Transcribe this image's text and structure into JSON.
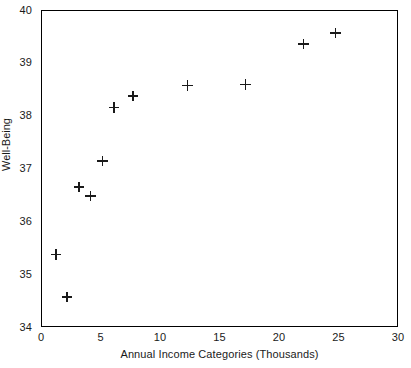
{
  "chart_data": {
    "type": "scatter",
    "title": "",
    "xlabel": "Annual Income Categories (Thousands)",
    "ylabel": "Well-Being",
    "xlim": [
      0,
      30
    ],
    "ylim": [
      34,
      40
    ],
    "xticks": [
      0,
      5,
      10,
      15,
      20,
      25,
      30
    ],
    "yticks": [
      34,
      35,
      36,
      37,
      38,
      39,
      40
    ],
    "xtick_labels": [
      "0",
      "5",
      "10",
      "15",
      "20",
      "25",
      "30"
    ],
    "ytick_labels": [
      "34",
      "35",
      "36",
      "37",
      "38",
      "39",
      "40"
    ],
    "grid": false,
    "legend": null,
    "marker": "plus",
    "marker_color": "#1a1a1a",
    "series": [
      {
        "name": "Well-Being vs Income",
        "points": [
          {
            "x": 1.2,
            "y": 35.36
          },
          {
            "x": 2.1,
            "y": 34.55
          },
          {
            "x": 3.1,
            "y": 36.65
          },
          {
            "x": 4.1,
            "y": 36.48
          },
          {
            "x": 5.1,
            "y": 37.14
          },
          {
            "x": 6.1,
            "y": 38.16
          },
          {
            "x": 7.7,
            "y": 38.38
          },
          {
            "x": 12.3,
            "y": 38.58
          },
          {
            "x": 17.2,
            "y": 38.6
          },
          {
            "x": 22.1,
            "y": 39.37
          },
          {
            "x": 24.8,
            "y": 39.58
          }
        ]
      }
    ]
  },
  "style": {
    "background": "#ffffff",
    "axis_color": "#000000",
    "text_color": "#1a1a1a"
  }
}
